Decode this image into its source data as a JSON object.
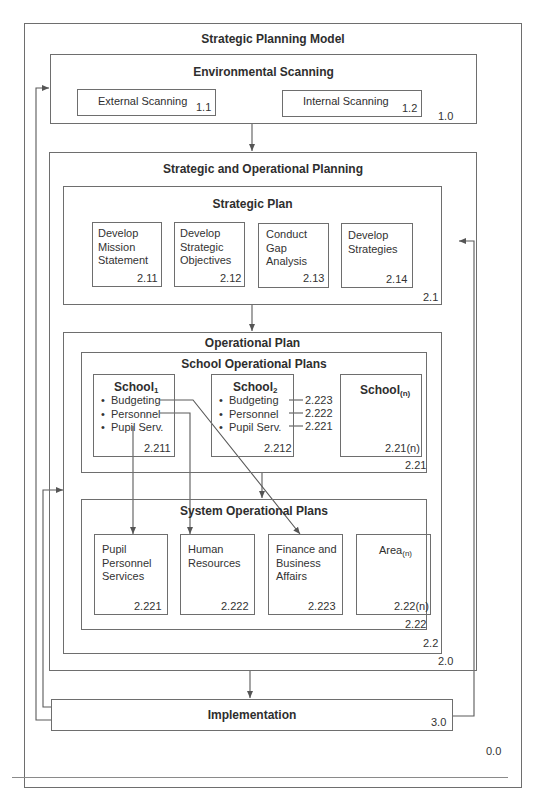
{
  "diagram": {
    "title": "Strategic Planning Model",
    "outer_number": "0.0",
    "environmental_scanning": {
      "title": "Environmental Scanning",
      "number": "1.0",
      "items": [
        {
          "label": "External Scanning",
          "number": "1.1"
        },
        {
          "label": "Internal Scanning",
          "number": "1.2"
        }
      ]
    },
    "strategic_operational_planning": {
      "title": "Strategic and Operational Planning",
      "number": "2.0",
      "strategic_plan": {
        "title": "Strategic Plan",
        "number": "2.1",
        "items": [
          {
            "label": "Develop Mission Statement",
            "number": "2.11"
          },
          {
            "label": "Develop Strategic Objectives",
            "number": "2.12"
          },
          {
            "label": "Conduct Gap Analysis",
            "number": "2.13"
          },
          {
            "label": "Develop Strategies",
            "number": "2.14"
          }
        ]
      },
      "operational_plan": {
        "title": "Operational Plan",
        "number": "2.2",
        "school_plans": {
          "title": "School Operational Plans",
          "number": "2.21",
          "schools": [
            {
              "name": "School",
              "sub": "1",
              "number": "2.211",
              "bullets": [
                "Budgeting",
                "Personnel",
                "Pupil Serv."
              ]
            },
            {
              "name": "School",
              "sub": "2",
              "number": "2.212",
              "bullets": [
                "Budgeting",
                "Personnel",
                "Pupil Serv."
              ],
              "refs": [
                "2.223",
                "2.222",
                "2.221"
              ]
            },
            {
              "name": "School",
              "sub": "(n)",
              "number": "2.21(n)"
            }
          ]
        },
        "system_plans": {
          "title": "System Operational Plans",
          "number": "2.22",
          "items": [
            {
              "label": "Pupil Personnel Services",
              "number": "2.221"
            },
            {
              "label": "Human Resources",
              "number": "2.222"
            },
            {
              "label": "Finance and Business Affairs",
              "number": "2.223"
            },
            {
              "label": "Area",
              "sub": "(n)",
              "number": "2.22(n)"
            }
          ]
        }
      }
    },
    "implementation": {
      "title": "Implementation",
      "number": "3.0"
    }
  }
}
